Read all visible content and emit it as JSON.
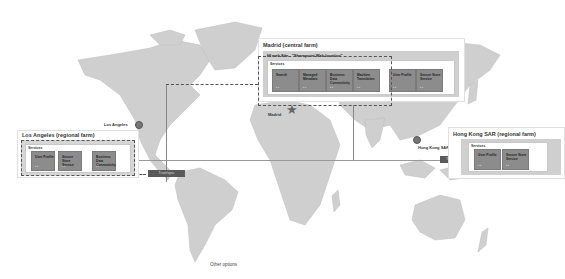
{
  "map": {
    "style": "grayscale world map",
    "land_color": "#cfcfcf"
  },
  "farms": {
    "madrid": {
      "title": "Madrid (central farm)",
      "site_title": "HI web Site - \"Sharepoint Web location\"",
      "services_label": "Services",
      "tiles": [
        {
          "label": "Search"
        },
        {
          "label": "Managed Metadata"
        },
        {
          "label": "Business Data Connectivity"
        },
        {
          "label": "Machine Translation"
        },
        {
          "label": "User Profile"
        },
        {
          "label": "Secure Store Service"
        }
      ]
    },
    "los_angeles": {
      "title": "Los Angeles (regional farm)",
      "services_label": "Services",
      "tiles": [
        {
          "label": "User Profile"
        },
        {
          "label": "Secure Store Service"
        },
        {
          "label": "Business Data Connectivity"
        }
      ]
    },
    "hong_kong": {
      "title": "Hong Kong SAR (regional farm)",
      "services_label": "Services",
      "tiles": [
        {
          "label": "User Profile"
        },
        {
          "label": "Secure Store Service"
        }
      ]
    }
  },
  "cities": {
    "los_angeles": "Los Angeles",
    "madrid": "Madrid",
    "hong_kong": "Hong Kong SAR"
  },
  "connectors": {
    "la": "Trust/sync",
    "hk": "Trust/sync"
  },
  "tile_icons": "▪ ▪",
  "footer": {
    "other_options": "Other options"
  },
  "icons": {
    "madrid_marker": "★"
  }
}
